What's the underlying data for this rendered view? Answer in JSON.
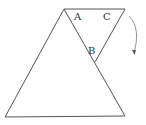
{
  "diagram": {
    "type": "geometry",
    "labels": {
      "a": "A",
      "b": "B",
      "c": "C"
    },
    "colors": {
      "stroke": "#555555",
      "text": "#333333",
      "background": "#ffffff"
    },
    "large_triangle": {
      "vertices": [
        [
          64,
          9
        ],
        [
          5,
          117
        ],
        [
          125,
          116
        ]
      ]
    },
    "small_triangle": {
      "vertices": [
        [
          64,
          9
        ],
        [
          125,
          9
        ],
        [
          95,
          62
        ]
      ]
    },
    "arrow": {
      "direction": "clockwise-down",
      "icon": "curved-arrow-icon"
    }
  }
}
